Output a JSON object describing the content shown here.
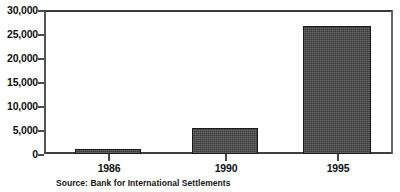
{
  "chart_data": {
    "type": "bar",
    "title": "",
    "subtitle": "",
    "xlabel": "",
    "ylabel": "",
    "categories": [
      "1986",
      "1990",
      "1995"
    ],
    "values": [
      1100,
      5400,
      27000
    ],
    "series": [
      {
        "name": "",
        "values": [
          1100,
          5400,
          27000
        ]
      }
    ],
    "ylim": [
      0,
      30000
    ],
    "yticks": [
      0,
      5000,
      10000,
      15000,
      20000,
      25000,
      30000
    ],
    "ytick_labels": [
      "0",
      "5,000",
      "10,000",
      "15,000",
      "20,000",
      "25,000",
      "30,000"
    ],
    "xtick_labels": [
      "1986",
      "1990",
      "1995"
    ],
    "grid": false,
    "legend": false,
    "legend_position": "none",
    "annotations": [
      "Source: Bank for International Settlements"
    ],
    "bar_fill_color": "#4a4a4a",
    "bar_edge_color": "#1a1a1a",
    "axis_color": "#4a4a4a",
    "background_color": "#ffffff"
  },
  "source_note": "Source: Bank for International Settlements"
}
